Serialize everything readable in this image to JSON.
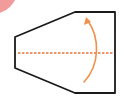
{
  "diagram": {
    "title": "Fold instruction",
    "colors": {
      "outline": "#1a1a1a",
      "fold_line": "#e8743a",
      "arrow": "#f0904a",
      "corner_marker": "#f08a8a",
      "background": "#ffffff"
    },
    "shape": {
      "type": "hexagon-trapezoid",
      "points": "15,37 75,12 115,12 115,93 75,93 15,68"
    },
    "fold_line": {
      "style": "dashed",
      "x1": 18,
      "y1": 53,
      "x2": 113,
      "y2": 53
    },
    "arrow": {
      "direction": "up",
      "path": "M84,82 C100,65 100,38 88,21"
    },
    "corner_marker": {
      "cx": -8,
      "cy": -12,
      "r": 26
    }
  }
}
